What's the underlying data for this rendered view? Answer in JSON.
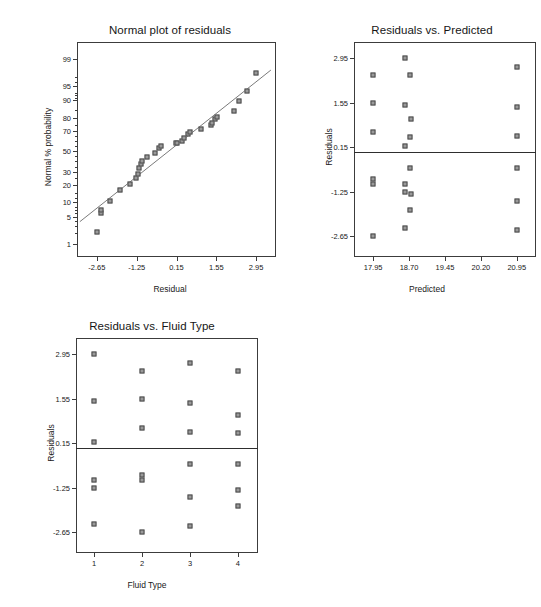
{
  "figure": {
    "background": "#ffffff",
    "marker_fill": "#9a9a9a",
    "marker_stroke": "#4a4a4a",
    "axis_color": "#3c3c3c"
  },
  "chart_data": [
    {
      "type": "scatter",
      "id": "normal-plot-of-residuals",
      "title": "Normal plot of residuals",
      "xlabel": "Residual",
      "ylabel": "Normal % probability",
      "xlim": [
        -3.35,
        3.65
      ],
      "xticks": [
        "-2.65",
        "-1.25",
        "0.15",
        "1.55",
        "2.95"
      ],
      "xtick_values": [
        -2.65,
        -1.25,
        0.15,
        1.55,
        2.95
      ],
      "yticks": [
        "99",
        "95",
        "90",
        "80",
        "70",
        "50",
        "30",
        "20",
        "10",
        "5",
        "1"
      ],
      "ytick_values": [
        99,
        95,
        90,
        80,
        70,
        50,
        30,
        20,
        10,
        5,
        1
      ],
      "ylim_probability": [
        0.4,
        99.7
      ],
      "grid": false,
      "legend": null,
      "reference_line": {
        "label": "normal fit line",
        "visible": true
      },
      "points": [
        {
          "x": -2.66,
          "p": 2.1
        },
        {
          "x": -2.52,
          "p": 6.2
        },
        {
          "x": -2.5,
          "p": 6.9
        },
        {
          "x": -2.19,
          "p": 10.8
        },
        {
          "x": -1.84,
          "p": 16.5
        },
        {
          "x": -1.47,
          "p": 21.0
        },
        {
          "x": -1.27,
          "p": 25.0
        },
        {
          "x": -1.2,
          "p": 28.5
        },
        {
          "x": -1.17,
          "p": 33.5
        },
        {
          "x": -1.1,
          "p": 37.5
        },
        {
          "x": -1.05,
          "p": 40.5
        },
        {
          "x": -0.9,
          "p": 44.0
        },
        {
          "x": -0.62,
          "p": 48.5
        },
        {
          "x": -0.45,
          "p": 53.5
        },
        {
          "x": -0.38,
          "p": 55.5
        },
        {
          "x": 0.12,
          "p": 58.0
        },
        {
          "x": 0.15,
          "p": 58.5
        },
        {
          "x": 0.33,
          "p": 60.5
        },
        {
          "x": 0.4,
          "p": 63.5
        },
        {
          "x": 0.55,
          "p": 67.0
        },
        {
          "x": 0.62,
          "p": 68.5
        },
        {
          "x": 1.02,
          "p": 71.5
        },
        {
          "x": 1.36,
          "p": 74.5
        },
        {
          "x": 1.41,
          "p": 76.5
        },
        {
          "x": 1.52,
          "p": 79.0
        },
        {
          "x": 1.56,
          "p": 80.5
        },
        {
          "x": 2.18,
          "p": 84.5
        },
        {
          "x": 2.34,
          "p": 89.5
        },
        {
          "x": 2.62,
          "p": 93.5
        },
        {
          "x": 2.95,
          "p": 97.5
        }
      ]
    },
    {
      "type": "scatter",
      "id": "residuals-vs-predicted",
      "title": "Residuals vs. Predicted",
      "xlabel": "Predicted",
      "ylabel": "Residuals",
      "xlim": [
        17.55,
        21.35
      ],
      "xticks": [
        "17.95",
        "18.70",
        "19.45",
        "20.20",
        "20.95"
      ],
      "xtick_values": [
        17.95,
        18.7,
        19.45,
        20.2,
        20.95
      ],
      "yticks": [
        "2.95",
        "1.55",
        "0.15",
        "-1.25",
        "-2.65"
      ],
      "ytick_values": [
        2.95,
        1.55,
        0.15,
        -1.25,
        -2.65
      ],
      "ylim": [
        -3.3,
        3.45
      ],
      "grid": false,
      "legend": null,
      "reference_line": {
        "label": "zero residual line",
        "y": 0.0,
        "visible": true
      },
      "points": [
        {
          "x": 17.95,
          "y": 2.4
        },
        {
          "x": 17.95,
          "y": 1.55
        },
        {
          "x": 17.95,
          "y": 0.62
        },
        {
          "x": 17.95,
          "y": -0.85
        },
        {
          "x": 17.95,
          "y": -1.0
        },
        {
          "x": 17.95,
          "y": -2.65
        },
        {
          "x": 18.62,
          "y": 2.95
        },
        {
          "x": 18.72,
          "y": 2.4
        },
        {
          "x": 18.62,
          "y": 1.48
        },
        {
          "x": 18.75,
          "y": 1.02
        },
        {
          "x": 18.72,
          "y": 0.48
        },
        {
          "x": 18.62,
          "y": 0.2
        },
        {
          "x": 18.72,
          "y": -0.52
        },
        {
          "x": 18.62,
          "y": -1.02
        },
        {
          "x": 18.62,
          "y": -1.25
        },
        {
          "x": 18.75,
          "y": -1.32
        },
        {
          "x": 18.72,
          "y": -1.82
        },
        {
          "x": 18.62,
          "y": -2.38
        },
        {
          "x": 20.95,
          "y": 2.65
        },
        {
          "x": 20.95,
          "y": 1.42
        },
        {
          "x": 20.95,
          "y": 0.5
        },
        {
          "x": 20.95,
          "y": -0.5
        },
        {
          "x": 20.95,
          "y": -1.55
        },
        {
          "x": 20.95,
          "y": -2.45
        }
      ]
    },
    {
      "type": "scatter",
      "id": "residuals-vs-fluid-type",
      "title": "Residuals vs. Fluid Type",
      "xlabel": "Fluid Type",
      "ylabel": "Residuals",
      "xlim": [
        0.62,
        4.42
      ],
      "xticks": [
        "1",
        "2",
        "3",
        "4"
      ],
      "xtick_values": [
        1,
        2,
        3,
        4
      ],
      "yticks": [
        "2.95",
        "1.55",
        "0.15",
        "-1.25",
        "-2.65"
      ],
      "ytick_values": [
        2.95,
        1.55,
        0.15,
        -1.25,
        -2.65
      ],
      "ylim": [
        -3.3,
        3.45
      ],
      "grid": false,
      "legend": null,
      "reference_line": {
        "label": "zero residual line",
        "y": 0.0,
        "visible": true
      },
      "points": [
        {
          "x": 1,
          "y": 2.95
        },
        {
          "x": 1,
          "y": 1.48
        },
        {
          "x": 1,
          "y": 0.2
        },
        {
          "x": 1,
          "y": -1.02
        },
        {
          "x": 1,
          "y": -1.25
        },
        {
          "x": 1,
          "y": -2.38
        },
        {
          "x": 2,
          "y": 2.4
        },
        {
          "x": 2,
          "y": 1.55
        },
        {
          "x": 2,
          "y": 0.62
        },
        {
          "x": 2,
          "y": -0.85
        },
        {
          "x": 2,
          "y": -1.0
        },
        {
          "x": 2,
          "y": -2.65
        },
        {
          "x": 3,
          "y": 2.65
        },
        {
          "x": 3,
          "y": 1.42
        },
        {
          "x": 3,
          "y": 0.5
        },
        {
          "x": 3,
          "y": -0.5
        },
        {
          "x": 3,
          "y": -1.55
        },
        {
          "x": 3,
          "y": -2.45
        },
        {
          "x": 4,
          "y": 2.4
        },
        {
          "x": 4,
          "y": 1.02
        },
        {
          "x": 4,
          "y": 0.48
        },
        {
          "x": 4,
          "y": -0.52
        },
        {
          "x": 4,
          "y": -1.32
        },
        {
          "x": 4,
          "y": -1.82
        }
      ]
    }
  ]
}
